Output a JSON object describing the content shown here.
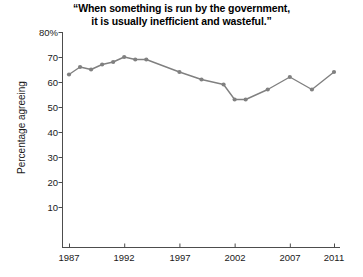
{
  "chart_data": {
    "type": "line",
    "title": "“When something is run by the government, it is usually inefficient and wasteful.”",
    "title_lines": [
      "“When something is run by the government,",
      "it is usually inefficient and wasteful.”"
    ],
    "xlabel": "",
    "ylabel": "Percentage agreeing",
    "ylim": [
      0,
      80
    ],
    "xlim": [
      1987,
      2011
    ],
    "grid": false,
    "legend": null,
    "series_color": "#808080",
    "axis_color": "#4d4d4d",
    "y_ticks": [
      80,
      70,
      60,
      50,
      40,
      30,
      20,
      10
    ],
    "y_tick_labels": [
      "80%",
      "70",
      "60",
      "50",
      "40",
      "30",
      "20",
      "10"
    ],
    "x_ticks": [
      1987,
      1992,
      1997,
      2002,
      2007,
      2011
    ],
    "x_tick_labels": [
      "1987",
      "1992",
      "1997",
      "2002",
      "2007",
      "2011"
    ],
    "x": [
      1987,
      1988,
      1989,
      1990,
      1991,
      1992,
      1993,
      1994,
      1997,
      1999,
      2001,
      2002,
      2003,
      2005,
      2007,
      2009,
      2011
    ],
    "values": [
      63,
      66,
      65,
      67,
      68,
      70,
      69,
      69,
      64,
      61,
      59,
      53,
      53,
      57,
      62,
      57,
      64
    ]
  }
}
